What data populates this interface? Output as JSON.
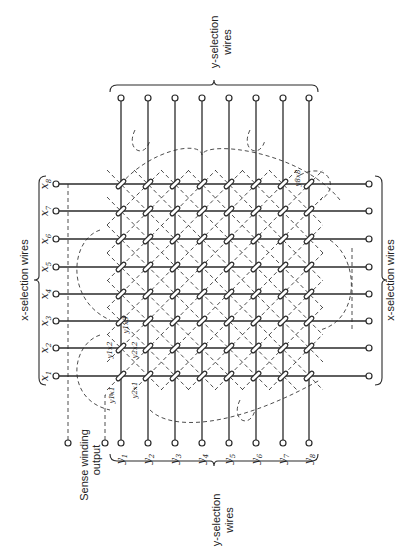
{
  "figure": {
    "orientation": "rotated 90 degrees counter-clockwise",
    "colors": {
      "ink": "#2a2a2a",
      "background": "#ffffff"
    }
  },
  "labels": {
    "x_selection_left": "x-selection wires",
    "x_selection_right": "x-selection wires",
    "y_selection_top_line1": "y-selection",
    "y_selection_top_line2": "wires",
    "y_selection_bottom_line1": "y-selection",
    "y_selection_bottom_line2": "wires",
    "sense_line1": "Sense winding",
    "sense_line2": "output"
  },
  "x_wires": [
    {
      "name": "x",
      "sub": "1"
    },
    {
      "name": "x",
      "sub": "2"
    },
    {
      "name": "x",
      "sub": "3"
    },
    {
      "name": "x",
      "sub": "4"
    },
    {
      "name": "x",
      "sub": "5"
    },
    {
      "name": "x",
      "sub": "6"
    },
    {
      "name": "x",
      "sub": "7"
    },
    {
      "name": "x",
      "sub": "8"
    }
  ],
  "y_wires": [
    {
      "name": "y",
      "sub": "1"
    },
    {
      "name": "y",
      "sub": "2"
    },
    {
      "name": "y",
      "sub": "3"
    },
    {
      "name": "y",
      "sub": "4"
    },
    {
      "name": "y",
      "sub": "5"
    },
    {
      "name": "y",
      "sub": "6"
    },
    {
      "name": "y",
      "sub": "7"
    },
    {
      "name": "y",
      "sub": "8"
    }
  ],
  "core_labels": [
    {
      "text": "y1x1"
    },
    {
      "text": "y1x2"
    },
    {
      "text": "y1x3"
    },
    {
      "text": "y2x1"
    },
    {
      "text": "y2x2"
    },
    {
      "text": "y8x8"
    }
  ],
  "grid": {
    "rows": 8,
    "cols": 8,
    "cores": 64
  }
}
